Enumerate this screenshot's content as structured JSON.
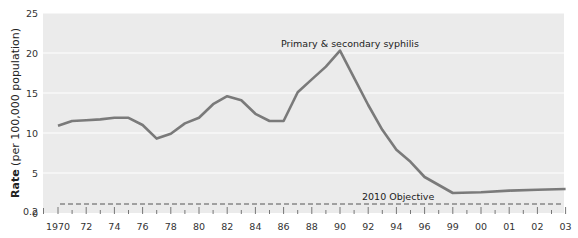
{
  "chart_data": {
    "type": "line",
    "title": "",
    "xlabel": "",
    "ylabel": "Rate (per 100,000 population)",
    "ylabel_bold": "Rate",
    "ylabel_rest": " (per 100,000 population)",
    "ylim": [
      0,
      25
    ],
    "yticks": [
      0,
      0.2,
      5,
      10,
      15,
      20,
      25
    ],
    "ytick_labels": [
      "0",
      "0.2",
      "5",
      "10",
      "15",
      "20",
      "25"
    ],
    "grid": true,
    "x_tick_labels": [
      "1970",
      "72",
      "74",
      "76",
      "78",
      "80",
      "82",
      "84",
      "86",
      "88",
      "90",
      "92",
      "94",
      "96",
      "99",
      "00",
      "01",
      "02",
      "03"
    ],
    "x_tick_slots": [
      0,
      2,
      4,
      6,
      8,
      10,
      12,
      14,
      16,
      18,
      20,
      22,
      24,
      26,
      28,
      30,
      32,
      34,
      36
    ],
    "series": [
      {
        "name": "Primary & secondary syphilis",
        "color": "#7a7a7a",
        "x": [
          1970,
          1971,
          1972,
          1973,
          1974,
          1975,
          1976,
          1977,
          1978,
          1979,
          1980,
          1981,
          1982,
          1983,
          1984,
          1985,
          1986,
          1987,
          1988,
          1989,
          1990,
          1991,
          1992,
          1993,
          1994,
          1995,
          1996,
          1999,
          2000,
          2001,
          2002,
          2003
        ],
        "slots": [
          0,
          1,
          2,
          3,
          4,
          5,
          6,
          7,
          8,
          9,
          10,
          11,
          12,
          13,
          14,
          15,
          16,
          17,
          18,
          19,
          20,
          21,
          22,
          23,
          24,
          25,
          26,
          28,
          30,
          32,
          34,
          36
        ],
        "values": [
          10.9,
          11.5,
          11.6,
          11.7,
          11.9,
          11.9,
          11.0,
          9.3,
          9.9,
          11.2,
          11.9,
          13.6,
          14.6,
          14.1,
          12.4,
          11.5,
          11.5,
          15.1,
          16.7,
          18.3,
          20.3,
          16.9,
          13.5,
          10.4,
          7.9,
          6.4,
          4.5,
          2.5,
          2.6,
          2.8,
          2.9,
          3.0
        ]
      }
    ],
    "reference_lines": [
      {
        "name": "2010 Objective",
        "value": 0.2,
        "style": "dashed"
      }
    ],
    "annotations": [
      {
        "text": "Primary & secondary syphilis",
        "near": "1990 peak"
      },
      {
        "text": "2010 Objective",
        "near": "dashed line at 0.2"
      }
    ],
    "legend": "none (direct labels)"
  }
}
